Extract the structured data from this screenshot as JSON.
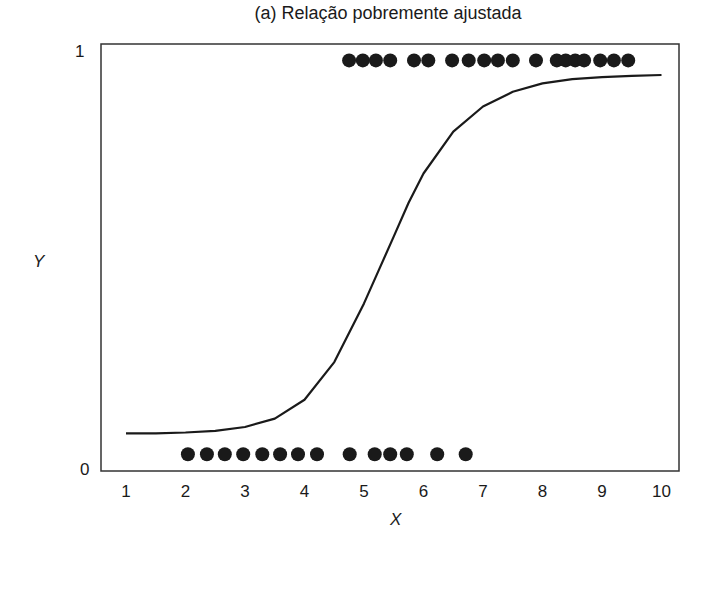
{
  "chart_data": {
    "type": "scatter",
    "title": "(a) Relação pobremente ajustada",
    "xlabel": "X",
    "ylabel": "Y",
    "xlim": [
      0.6,
      10.3
    ],
    "ylim": [
      0,
      1
    ],
    "x_ticks": [
      "1",
      "2",
      "3",
      "4",
      "5",
      "6",
      "7",
      "8",
      "9",
      "10"
    ],
    "y_ticks": [
      "0",
      "1"
    ],
    "grid": false,
    "legend": null,
    "series": [
      {
        "name": "Y = 1 observations",
        "type": "scatter",
        "y": 0.98,
        "x": [
          4.75,
          4.98,
          5.2,
          5.44,
          5.84,
          6.08,
          6.48,
          6.76,
          7.02,
          7.25,
          7.5,
          7.89,
          8.24,
          8.39,
          8.55,
          8.7,
          8.97,
          9.2,
          9.44
        ]
      },
      {
        "name": "Y = 0 observations",
        "type": "scatter",
        "y": 0.04,
        "x": [
          2.04,
          2.36,
          2.66,
          2.97,
          3.29,
          3.59,
          3.89,
          4.21,
          4.76,
          5.18,
          5.44,
          5.72,
          6.23,
          6.71
        ]
      },
      {
        "name": "fitted logistic curve",
        "type": "line",
        "x": [
          1,
          1.5,
          2,
          2.5,
          3,
          3.5,
          4,
          4.5,
          5,
          5.25,
          5.5,
          5.75,
          6,
          6.5,
          7,
          7.5,
          8,
          8.5,
          9,
          9.5,
          10
        ],
        "values": [
          0.09,
          0.09,
          0.092,
          0.096,
          0.105,
          0.125,
          0.17,
          0.26,
          0.4,
          0.48,
          0.56,
          0.64,
          0.71,
          0.81,
          0.87,
          0.905,
          0.925,
          0.935,
          0.94,
          0.943,
          0.945
        ]
      }
    ]
  },
  "labels": {
    "title": "(a) Relação pobremente ajustada",
    "xlabel": "X",
    "ylabel": "Y",
    "ytick_0": "0",
    "ytick_1": "1"
  },
  "colors": {
    "ink": "#1a1a1a",
    "background": "#ffffff"
  }
}
